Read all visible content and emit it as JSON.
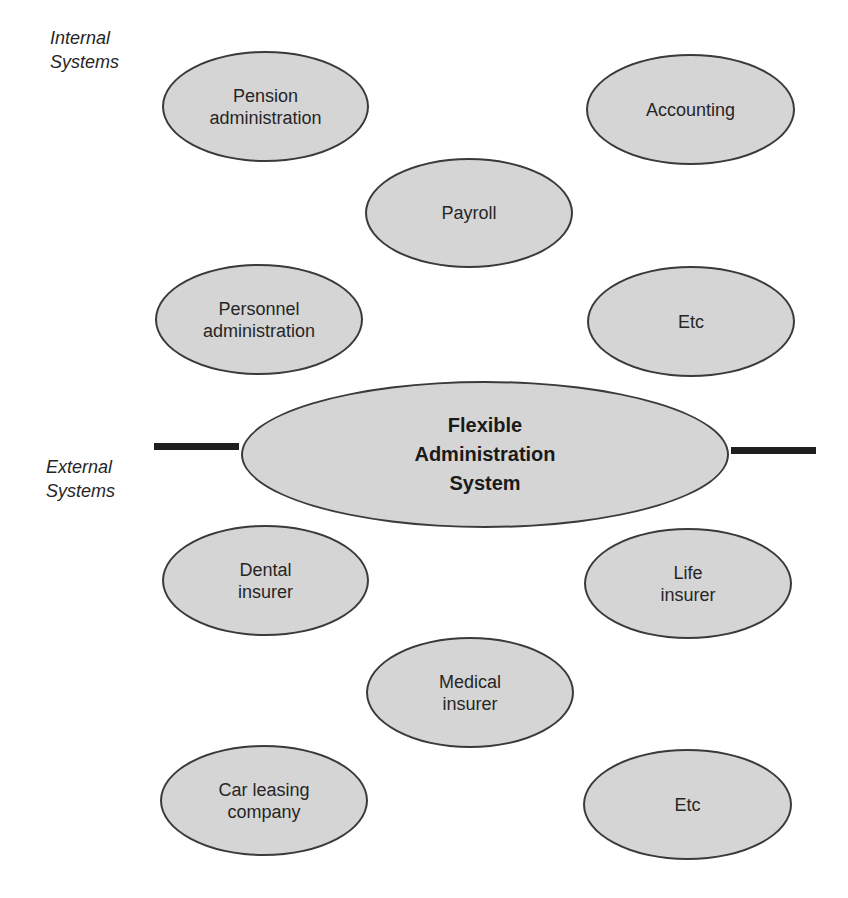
{
  "colors": {
    "node_fill": "#d5d5d5",
    "node_outline": "#3a3a3a",
    "connector": "#1e1e1e",
    "background": "#ffffff"
  },
  "groups": {
    "internal": {
      "line1": "Internal",
      "line2": "Systems"
    },
    "external": {
      "line1": "External",
      "line2": "Systems"
    }
  },
  "central": {
    "line1": "Flexible",
    "line2": "Administration",
    "line3": "System"
  },
  "internal_systems": [
    {
      "line1": "Pension",
      "line2": "administration"
    },
    {
      "line1": "Accounting",
      "line2": ""
    },
    {
      "line1": "Payroll",
      "line2": ""
    },
    {
      "line1": "Personnel",
      "line2": "administration"
    },
    {
      "line1": "Etc",
      "line2": ""
    }
  ],
  "external_systems": [
    {
      "line1": "Dental",
      "line2": "insurer"
    },
    {
      "line1": "Life",
      "line2": "insurer"
    },
    {
      "line1": "Medical",
      "line2": "insurer"
    },
    {
      "line1": "Car leasing",
      "line2": "company"
    },
    {
      "line1": "Etc",
      "line2": ""
    }
  ]
}
